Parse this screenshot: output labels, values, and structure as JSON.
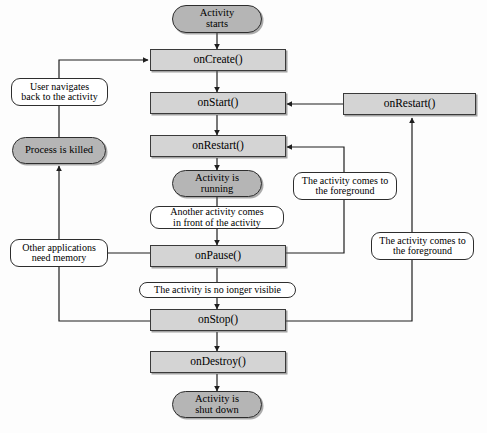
{
  "diagram": {
    "colors": {
      "method_fill": "#d4d4d4",
      "state_fill": "#b5b5b5",
      "condition_fill": "#ffffff",
      "stroke": "#2e2e2e",
      "background": "#fdfdfd"
    },
    "nodes": {
      "activity_starts": {
        "label": "Activity\nstarts",
        "type": "state"
      },
      "on_create": {
        "label": "onCreate()",
        "type": "method"
      },
      "on_start": {
        "label": "onStart()",
        "type": "method"
      },
      "on_restart_center": {
        "label": "onRestart()",
        "type": "method"
      },
      "on_restart_right": {
        "label": "onRestart()",
        "type": "method"
      },
      "activity_running": {
        "label": "Activity is\nrunning",
        "type": "state"
      },
      "on_pause": {
        "label": "onPause()",
        "type": "method"
      },
      "on_stop": {
        "label": "onStop()",
        "type": "method"
      },
      "on_destroy": {
        "label": "onDestroy()",
        "type": "method"
      },
      "activity_shut_down": {
        "label": "Activity is\nshut down",
        "type": "state"
      },
      "process_killed": {
        "label": "Process is killed",
        "type": "state"
      },
      "user_navigates_back": {
        "label": "User navigates\nback to the activity",
        "type": "condition"
      },
      "other_apps_need_memory": {
        "label": "Other applications\nneed memory",
        "type": "condition"
      },
      "another_activity_in_front": {
        "label": "Another activity comes\nin front of the activity",
        "type": "condition"
      },
      "no_longer_visible": {
        "label": "The activity is no ionger visibie",
        "type": "condition"
      },
      "foreground_from_pause": {
        "label": "The activity comes to\nthe foreground",
        "type": "condition"
      },
      "foreground_from_stop": {
        "label": "The activity comes to\nthe foreground",
        "type": "condition"
      }
    },
    "edges": [
      {
        "from": "activity_starts",
        "to": "on_create",
        "label": ""
      },
      {
        "from": "on_create",
        "to": "on_start",
        "label": ""
      },
      {
        "from": "on_start",
        "to": "on_restart_center",
        "label": ""
      },
      {
        "from": "on_restart_center",
        "to": "activity_running",
        "label": ""
      },
      {
        "from": "activity_running",
        "to": "on_pause",
        "label": "Another activity comes in front of the activity"
      },
      {
        "from": "on_pause",
        "to": "on_stop",
        "label": "The activity is no ionger visibie"
      },
      {
        "from": "on_stop",
        "to": "on_destroy",
        "label": ""
      },
      {
        "from": "on_destroy",
        "to": "activity_shut_down",
        "label": ""
      },
      {
        "from": "on_restart_right",
        "to": "on_start",
        "label": ""
      },
      {
        "from": "on_pause",
        "to": "on_restart_center",
        "label": "The activity comes to the foreground"
      },
      {
        "from": "on_stop",
        "to": "on_restart_right",
        "label": "The activity comes to the foreground"
      },
      {
        "from": "on_pause",
        "to": "process_killed",
        "label": "Other applications need memory"
      },
      {
        "from": "on_stop",
        "to": "process_killed",
        "label": "Other applications need memory"
      },
      {
        "from": "process_killed",
        "to": "on_create",
        "label": "User navigates back to the activity"
      }
    ]
  }
}
